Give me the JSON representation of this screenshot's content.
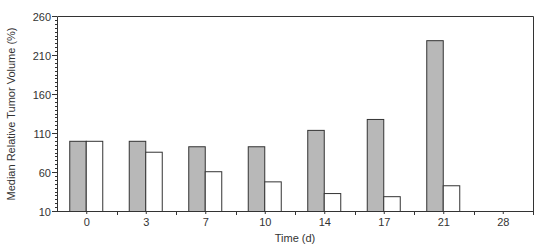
{
  "chart_data": {
    "type": "bar",
    "title": "",
    "xlabel": "Time (d)",
    "ylabel": "Median Relative Tumor Volume (%)",
    "categories": [
      "0",
      "3",
      "7",
      "10",
      "14",
      "17",
      "21",
      "28"
    ],
    "series": [
      {
        "name": "Control",
        "color": "#b8b8b8",
        "values": [
          100,
          100,
          93,
          93,
          114,
          128,
          229,
          null
        ]
      },
      {
        "name": "Treated",
        "color": "#ffffff",
        "values": [
          100,
          86,
          61,
          48,
          33,
          29,
          43,
          null
        ]
      }
    ],
    "ylim": [
      10,
      260
    ],
    "yticks": [
      10,
      60,
      110,
      160,
      210,
      260
    ],
    "y_minor_step": 5,
    "grid": false,
    "legend": "none"
  }
}
